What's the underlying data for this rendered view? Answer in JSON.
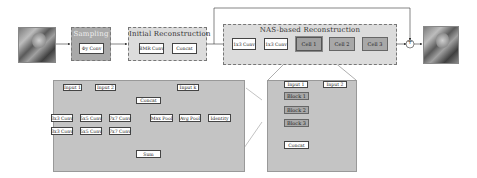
{
  "input_image": "lena-input-image",
  "output_image": "lena-output-image",
  "sampling": {
    "title": "Sampling",
    "op": "Φy Conv"
  },
  "initial": {
    "title": "Initial Reconstruction",
    "ops": [
      "BMR Conv",
      "Concat"
    ]
  },
  "nas": {
    "title": "NAS-based Reconstruction",
    "convs": [
      "1x3 Conv",
      "1x3 Conv"
    ],
    "cells": [
      "Cell 1",
      "Cell 2",
      "Cell 3"
    ]
  },
  "adder_symbol": "+",
  "cell_detail": {
    "inputs": [
      "Input 1",
      "Input 2"
    ],
    "blocks": [
      "Block 1",
      "Block 2",
      "Block 3"
    ],
    "concat": "Concat"
  },
  "block_detail": {
    "inputs": [
      "Input 1",
      "Input 2",
      "Input k"
    ],
    "concat": "Concat",
    "ops_row1": [
      "3x3 Conv",
      "5x5 Conv",
      "7x7 Conv",
      "Max Pool",
      "Avg Pool",
      "Identity"
    ],
    "ops_row2": [
      "3x3 Conv",
      "5x5 Conv",
      "7x7 Conv"
    ],
    "sum": "Sum"
  }
}
